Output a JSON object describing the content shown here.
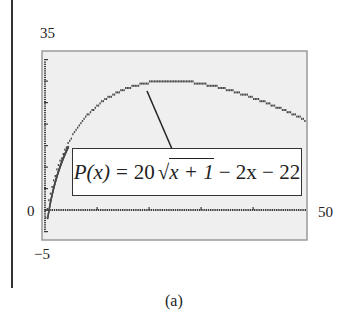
{
  "chart_data": {
    "type": "line",
    "title": "",
    "function": "P(x) = 20√(x+1) − 2x − 22",
    "formula_parts": {
      "lhs": "P(x)",
      "equals": "=",
      "coef": "20",
      "radicand": "x + 1",
      "rest": "− 2x − 22"
    },
    "xlabel": "",
    "ylabel": "",
    "xlim": [
      0,
      50
    ],
    "ylim": [
      -5,
      35
    ],
    "x_tick_labels": [
      "0",
      "50"
    ],
    "y_tick_labels": [
      "35",
      "0",
      "-5"
    ],
    "x": [
      0,
      2,
      4,
      6,
      8,
      10,
      12,
      14,
      16,
      18,
      20,
      22,
      24,
      26,
      28,
      30,
      32,
      34,
      36,
      38,
      40,
      42,
      44,
      46,
      48,
      50
    ],
    "series": [
      {
        "name": "P(x)",
        "values": [
          -2,
          8.64,
          14.72,
          18.92,
          22.0,
          24.33,
          26.11,
          27.46,
          28.46,
          29.18,
          29.65,
          29.92,
          30.0,
          29.93,
          29.7,
          29.36,
          28.89,
          28.32,
          27.66,
          26.9,
          26.06,
          25.15,
          24.16,
          23.11,
          22.0,
          20.83
        ]
      }
    ],
    "grid": false,
    "legend": "none",
    "annotation": "callout box with formula pointing to curve near maximum (x≈24, P≈30)"
  },
  "labels": {
    "y_max": "35",
    "y_zero": "0",
    "y_min": "−5",
    "x_max": "50"
  },
  "caption": "(a)",
  "colors": {
    "frame_fill": "#efefef",
    "frame_border": "#9a9a9a",
    "curve": "#4a4a4a",
    "axis": "#3a3a3a"
  }
}
